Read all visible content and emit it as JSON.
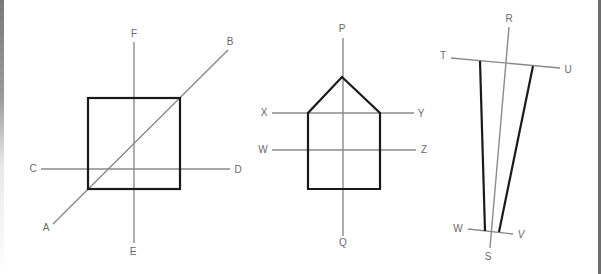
{
  "figures": [
    {
      "id": "figure-square",
      "labels": {
        "A": "A",
        "B": "B",
        "C": "C",
        "D": "D",
        "E": "E",
        "F": "F"
      },
      "lines": [
        {
          "name": "A-B",
          "from": [
            53,
            224
          ],
          "to": [
            228,
            50
          ]
        },
        {
          "name": "C-D",
          "from": [
            41,
            169
          ],
          "to": [
            230,
            169
          ]
        },
        {
          "name": "E-F",
          "from": [
            134,
            243
          ],
          "to": [
            134,
            42
          ]
        }
      ],
      "shape": {
        "type": "square",
        "x": 88,
        "y": 98,
        "width": 92,
        "height": 91
      }
    },
    {
      "id": "figure-pentagon",
      "labels": {
        "P": "P",
        "Q": "Q",
        "X": "X",
        "Y": "Y",
        "W": "W",
        "Z": "Z"
      },
      "lines": [
        {
          "name": "P-Q",
          "from": [
            343,
            38
          ],
          "to": [
            343,
            236
          ]
        },
        {
          "name": "X-Y",
          "from": [
            272,
            113
          ],
          "to": [
            414,
            113
          ]
        },
        {
          "name": "W-Z",
          "from": [
            272,
            150
          ],
          "to": [
            416,
            150
          ]
        }
      ],
      "shape": {
        "type": "house-pentagon",
        "points": [
          [
            342,
            77
          ],
          [
            380,
            113
          ],
          [
            380,
            189
          ],
          [
            308,
            189
          ],
          [
            308,
            113
          ]
        ]
      }
    },
    {
      "id": "figure-tapered",
      "labels": {
        "R": "R",
        "S": "S",
        "T": "T",
        "U": "U",
        "W": "W",
        "V": "V"
      },
      "lines": [
        {
          "name": "R-S",
          "from": [
            509,
            27
          ],
          "to": [
            490,
            248
          ]
        },
        {
          "name": "T-U",
          "from": [
            451,
            58
          ],
          "to": [
            560,
            68
          ]
        },
        {
          "name": "W-V",
          "from": [
            468,
            229
          ],
          "to": [
            513,
            234
          ]
        }
      ],
      "shape": {
        "type": "tapered-quadrilateral",
        "left_leg": [
          [
            480,
            61
          ],
          [
            485,
            231
          ]
        ],
        "right_leg": [
          [
            533,
            66
          ],
          [
            499,
            232
          ]
        ]
      }
    }
  ],
  "colors": {
    "axis_line": "#8a8a8a",
    "shape_outline": "#1a1a1a",
    "label_text": "#6a6a6a",
    "background": "#ffffff"
  }
}
